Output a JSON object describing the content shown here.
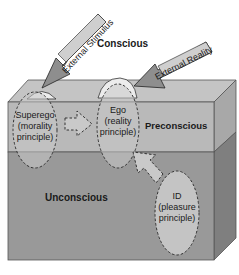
{
  "diagram": {
    "type": "freud-structure-of-mind",
    "levels": {
      "conscious": "Conscious",
      "preconscious": "Preconscious",
      "unconscious": "Unconscious"
    },
    "structures": {
      "superego": {
        "name": "Superego",
        "line2": "(morality",
        "line3": "principle)"
      },
      "ego": {
        "name": "Ego",
        "line2": "(reality",
        "line3": "principle)"
      },
      "id": {
        "name": "ID",
        "line2": "(pleasure",
        "line3": "principle)"
      }
    },
    "arrows": {
      "external_stimulus": "External Stimulus",
      "external_reality": "External Reality"
    },
    "colors": {
      "top_face": "#c4c4c4",
      "preconscious_face": "#b9b9b9",
      "unconscious_face": "#999999",
      "side_face_upper": "#a8a8a8",
      "side_face_lower": "#7f7f7f",
      "oval_fill": "#c9c9c9",
      "mound_fill": "#ececec",
      "arrow_fill": "#8e8e8e",
      "arrow_text_bg": "#cfcfcf"
    }
  }
}
